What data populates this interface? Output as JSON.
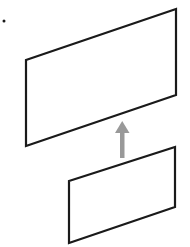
{
  "diagram": {
    "colors": {
      "outline": "#1a1a1a",
      "arrow": "#999999",
      "background": "#ffffff"
    },
    "upper_plane": {
      "points": "26,60 176,9 176,95 26,146"
    },
    "lower_plane": {
      "points": "69,181 175,147 175,207 69,243"
    },
    "arrow": {
      "direction": "up"
    },
    "dot": {
      "cx": 4,
      "cy": 21
    }
  }
}
